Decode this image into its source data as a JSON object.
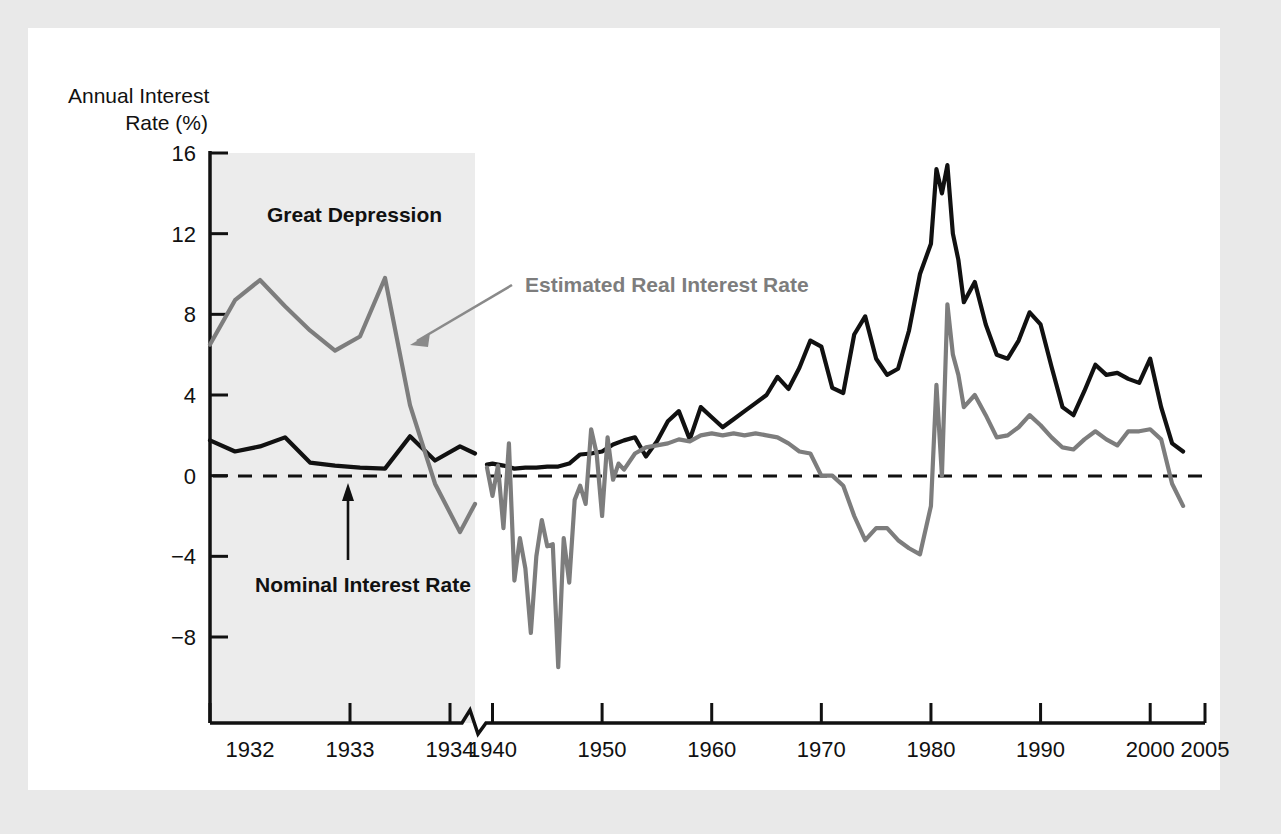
{
  "figure": {
    "background_color": "#e9e9e9",
    "panel_color": "#ffffff",
    "shade_color": "#ececec"
  },
  "chart_data": {
    "type": "line",
    "title": "",
    "ylabel_line1": "Annual Interest",
    "ylabel_line2": "Rate (%)",
    "xlabel": "",
    "ylim": [
      -10,
      16
    ],
    "yticks": [
      "16",
      "12",
      "8",
      "4",
      "0",
      "-4",
      "-8"
    ],
    "ytick_values": [
      16,
      12,
      8,
      4,
      0,
      -4,
      -8
    ],
    "xticks": [
      "1932",
      "1933",
      "1934",
      "1940",
      "1950",
      "1960",
      "1970",
      "1980",
      "1990",
      "2000",
      "2005"
    ],
    "xtick_values": [
      1932,
      1933,
      1934,
      1940,
      1950,
      1960,
      1970,
      1980,
      1990,
      2000,
      2005
    ],
    "axis_break_after": "1934",
    "grid": false,
    "zero_line": true,
    "zero_line_style": "dashed",
    "legend_position": "inline-annotations",
    "annotations": [
      {
        "text": "Great Depression",
        "style": "bold-black"
      },
      {
        "text": "Estimated Real Interest Rate",
        "style": "bold-gray",
        "arrow": "down-left"
      },
      {
        "text": "Nominal Interest Rate",
        "style": "bold-black",
        "arrow": "up"
      }
    ],
    "shaded_region": {
      "label": "Great Depression",
      "x_start": 1931.6,
      "x_end": 1934.25
    },
    "series": [
      {
        "name": "Nominal Interest Rate",
        "color": "#111111",
        "x": [
          1931.6,
          1931.85,
          1932.1,
          1932.35,
          1932.6,
          1932.85,
          1933.1,
          1933.35,
          1933.6,
          1933.85,
          1934.1,
          1934.25
        ],
        "values": [
          1.75,
          1.2,
          1.45,
          1.9,
          0.65,
          0.5,
          0.4,
          0.35,
          1.95,
          0.75,
          1.45,
          1.1
        ]
      },
      {
        "name": "Estimated Real Interest Rate",
        "color": "#7d7d7d",
        "x": [
          1931.6,
          1931.85,
          1932.1,
          1932.35,
          1932.6,
          1932.85,
          1933.1,
          1933.35,
          1933.6,
          1933.85,
          1934.1,
          1934.25
        ],
        "values": [
          6.5,
          8.7,
          9.7,
          8.4,
          7.2,
          6.2,
          6.9,
          9.8,
          3.5,
          -0.4,
          -2.8,
          -1.4
        ]
      },
      {
        "name": "Nominal Interest Rate (modern)",
        "color": "#111111",
        "x": [
          1939.5,
          1940,
          1941,
          1942,
          1943,
          1944,
          1945,
          1946,
          1947,
          1948,
          1949,
          1950,
          1951,
          1952,
          1953,
          1954,
          1955,
          1956,
          1957,
          1958,
          1959,
          1960,
          1961,
          1962,
          1963,
          1964,
          1965,
          1966,
          1967,
          1968,
          1969,
          1970,
          1971,
          1972,
          1973,
          1974,
          1975,
          1976,
          1977,
          1978,
          1979,
          1980,
          1980.5,
          1981,
          1981.5,
          1982,
          1982.5,
          1983,
          1984,
          1985,
          1986,
          1987,
          1988,
          1989,
          1990,
          1991,
          1992,
          1993,
          1994,
          1995,
          1996,
          1997,
          1998,
          1999,
          2000,
          2001,
          2002,
          2003
        ],
        "values": [
          0.55,
          0.6,
          0.5,
          0.35,
          0.4,
          0.4,
          0.45,
          0.45,
          0.6,
          1.05,
          1.1,
          1.2,
          1.55,
          1.75,
          1.9,
          0.95,
          1.7,
          2.7,
          3.2,
          1.8,
          3.4,
          2.9,
          2.4,
          2.8,
          3.2,
          3.6,
          4.0,
          4.9,
          4.3,
          5.35,
          6.7,
          6.4,
          4.35,
          4.1,
          7.0,
          7.9,
          5.8,
          5.0,
          5.3,
          7.2,
          10.0,
          11.5,
          15.2,
          14.0,
          15.4,
          12.0,
          10.7,
          8.6,
          9.6,
          7.5,
          6.0,
          5.8,
          6.7,
          8.1,
          7.5,
          5.4,
          3.4,
          3.0,
          4.2,
          5.5,
          5.0,
          5.1,
          4.8,
          4.6,
          5.8,
          3.4,
          1.6,
          1.2
        ]
      },
      {
        "name": "Estimated Real Interest Rate (modern)",
        "color": "#7d7d7d",
        "x": [
          1939.5,
          1940,
          1940.5,
          1941,
          1941.5,
          1942,
          1942.5,
          1943,
          1943.5,
          1944,
          1944.5,
          1945,
          1945.5,
          1946,
          1946.5,
          1947,
          1947.5,
          1948,
          1948.5,
          1949,
          1949.5,
          1950,
          1950.5,
          1951,
          1951.5,
          1952,
          1953,
          1954,
          1955,
          1956,
          1957,
          1958,
          1959,
          1960,
          1961,
          1962,
          1963,
          1964,
          1965,
          1966,
          1967,
          1968,
          1969,
          1970,
          1971,
          1972,
          1973,
          1974,
          1975,
          1976,
          1977,
          1978,
          1979,
          1980,
          1980.5,
          1981,
          1981.5,
          1982,
          1982.5,
          1983,
          1984,
          1985,
          1986,
          1987,
          1988,
          1989,
          1990,
          1991,
          1992,
          1993,
          1994,
          1995,
          1996,
          1997,
          1998,
          1999,
          2000,
          2001,
          2002,
          2003
        ],
        "values": [
          0.4,
          -1.0,
          0.5,
          -2.6,
          1.6,
          -5.2,
          -3.1,
          -4.6,
          -7.8,
          -4.0,
          -2.2,
          -3.5,
          -3.4,
          -9.5,
          -3.1,
          -5.3,
          -1.2,
          -0.5,
          -1.4,
          2.3,
          1.1,
          -2.0,
          1.9,
          -0.2,
          0.6,
          0.3,
          1.1,
          1.4,
          1.5,
          1.6,
          1.8,
          1.7,
          2.0,
          2.1,
          2.0,
          2.1,
          2.0,
          2.1,
          2.0,
          1.9,
          1.6,
          1.2,
          1.1,
          0.0,
          0.0,
          -0.5,
          -2.0,
          -3.2,
          -2.6,
          -2.6,
          -3.2,
          -3.6,
          -3.9,
          -1.5,
          4.5,
          0.0,
          8.5,
          6.0,
          5.0,
          3.4,
          4.0,
          3.0,
          1.9,
          2.0,
          2.4,
          3.0,
          2.5,
          1.9,
          1.4,
          1.3,
          1.8,
          2.2,
          1.8,
          1.5,
          2.2,
          2.2,
          2.3,
          1.8,
          -0.4,
          -1.5
        ]
      }
    ]
  }
}
